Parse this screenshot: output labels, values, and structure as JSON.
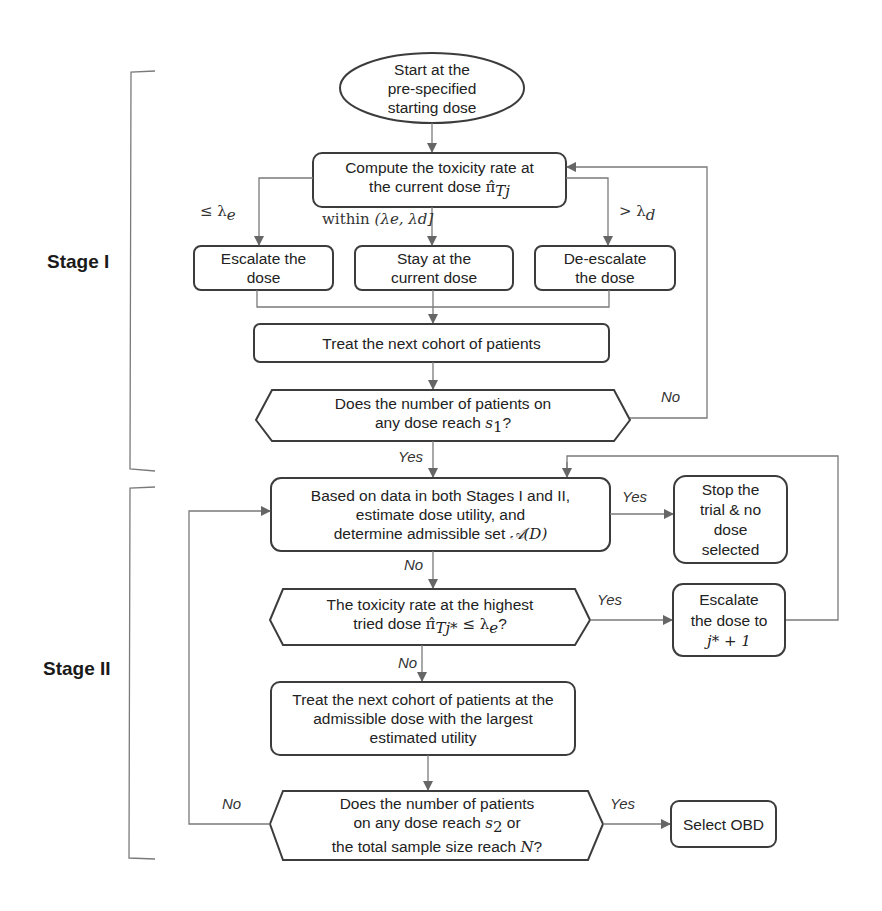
{
  "stages": {
    "stage1": "Stage I",
    "stage2": "Stage II"
  },
  "nodes": {
    "start": {
      "lines": [
        "Start at the",
        "pre-specified",
        "starting dose"
      ]
    },
    "compute": {
      "line1": "Compute the toxicity rate at",
      "line2_prefix": "the current dose ",
      "line2_math": "π̂",
      "line2_sub": "Tj"
    },
    "escalate": {
      "lines": [
        "Escalate the",
        "dose"
      ]
    },
    "stay": {
      "lines": [
        "Stay at  the",
        "current dose"
      ]
    },
    "deescalate": {
      "lines": [
        "De-escalate",
        "the dose"
      ]
    },
    "treat1": {
      "lines": [
        "Treat the next cohort of patients"
      ]
    },
    "decision1": {
      "line1": "Does the number of patients on",
      "line2_prefix": "any dose reach ",
      "line2_math": "s",
      "line2_sub": "1",
      "line2_suffix": "?"
    },
    "estimate": {
      "line1": "Based on data in both Stages I and II,",
      "line2": "estimate dose utility, and",
      "line3_prefix": "determine admissible set ",
      "line3_math": "𝒜(D)"
    },
    "stop": {
      "lines": [
        "Stop the",
        "trial & no",
        "dose",
        "selected"
      ]
    },
    "decision2": {
      "line1": "The toxicity rate at the highest",
      "line2_prefix": "tried dose ",
      "line2_math": "π̂",
      "line2_sub": "Tj*",
      "line2_suffix": " ≤ λ",
      "line2_sub2": "e",
      "line2_end": "?"
    },
    "escalate2": {
      "line1": "Escalate",
      "line2": "the dose to",
      "line3": "j* + 1"
    },
    "treat2": {
      "lines": [
        "Treat the next cohort of patients at the",
        "admissible dose with the largest",
        "estimated utility"
      ]
    },
    "decision3": {
      "line1": "Does the number of patients",
      "line2_prefix": "on any dose reach ",
      "line2_math": "s",
      "line2_sub": "2",
      "line2_suffix": " or",
      "line3_prefix": "the total sample size reach ",
      "line3_math": "N",
      "line3_suffix": "?"
    },
    "select": {
      "lines": [
        "Select OBD"
      ]
    }
  },
  "edge_labels": {
    "le_lambda_e": "≤ λ",
    "le_lambda_e_sub": "e",
    "within": "within ",
    "within_math": "(λe, λd]",
    "gt_lambda_d": "> λ",
    "gt_lambda_d_sub": "d",
    "no1": "No",
    "yes1": "Yes",
    "yes2": "Yes",
    "no2": "No",
    "yes3": "Yes",
    "no3": "No",
    "no4": "No",
    "yes4": "Yes"
  },
  "colors": {
    "line": "#7a7a7a",
    "box_border": "#3c3c3c",
    "arrow": "#666666",
    "background": "#ffffff"
  }
}
